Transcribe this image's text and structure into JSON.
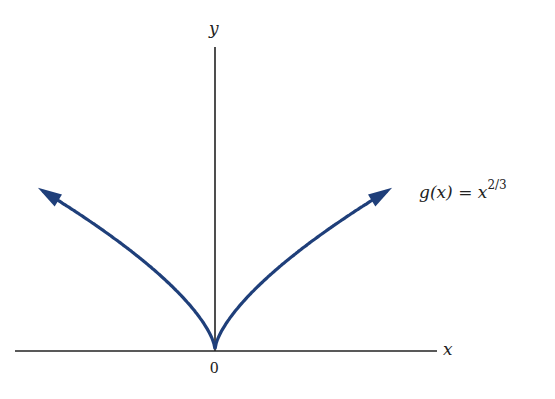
{
  "chart_data": {
    "type": "line",
    "title": "",
    "xlabel": "x",
    "ylabel": "y",
    "origin_label": "0",
    "series": [
      {
        "name": "g(x) = x^(2/3)",
        "label_function": "g(x) =",
        "label_base": "x",
        "label_exponent": "2/3",
        "color": "#1f3f7a",
        "x": [
          -8,
          -6,
          -4,
          -2,
          -1,
          -0.5,
          0,
          0.5,
          1,
          2,
          4,
          6,
          8
        ],
        "values": [
          4,
          3.3,
          2.52,
          1.59,
          1,
          0.63,
          0,
          0.63,
          1,
          1.59,
          2.52,
          3.3,
          4
        ]
      }
    ],
    "arrows_at_ends": true,
    "grid": false,
    "legend": "inline label at right end of curve"
  }
}
